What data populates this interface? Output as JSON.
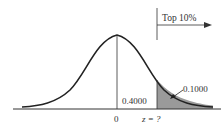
{
  "diagram": {
    "type": "normal-distribution",
    "annotation_top": "Top 10%",
    "label_center_area": "0.4000",
    "label_tail_area": "0.1000",
    "x_label_mean": "0",
    "x_label_z": "z = ?",
    "colors": {
      "curve": "#222222",
      "shade": "#9a9a9a",
      "axis": "#333333"
    }
  }
}
